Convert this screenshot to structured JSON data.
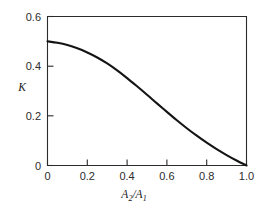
{
  "chart_data": {
    "type": "line",
    "title": "",
    "xlabel": "A2/A1",
    "xlabel_parts": {
      "base1": "A",
      "sub1": "2",
      "slash": "/",
      "base2": "A",
      "sub2": "1"
    },
    "ylabel": "K",
    "xlim": [
      0.0,
      1.0
    ],
    "ylim": [
      0.0,
      0.6
    ],
    "xticks": [
      0,
      0.2,
      0.4,
      0.6,
      0.8,
      1.0
    ],
    "xtick_labels": [
      "0",
      "0.2",
      "0.4",
      "0.6",
      "0.8",
      "1.0"
    ],
    "yticks": [
      0,
      0.2,
      0.4,
      0.6
    ],
    "ytick_labels": [
      "0",
      "0.2",
      "0.4",
      "0.6"
    ],
    "grid": false,
    "legend": null,
    "tick_direction": "in",
    "frame": "box",
    "series": [
      {
        "name": "K",
        "x": [
          0.0,
          0.05,
          0.1,
          0.15,
          0.2,
          0.25,
          0.3,
          0.35,
          0.4,
          0.45,
          0.5,
          0.55,
          0.6,
          0.65,
          0.7,
          0.75,
          0.8,
          0.85,
          0.9,
          0.95,
          1.0
        ],
        "y": [
          0.5,
          0.494,
          0.485,
          0.472,
          0.455,
          0.435,
          0.411,
          0.383,
          0.352,
          0.319,
          0.285,
          0.25,
          0.216,
          0.182,
          0.15,
          0.12,
          0.092,
          0.066,
          0.042,
          0.02,
          0.0
        ]
      }
    ]
  },
  "colors": {
    "curve": "#141414",
    "axis": "#2b2b2b",
    "background": "#ffffff"
  }
}
